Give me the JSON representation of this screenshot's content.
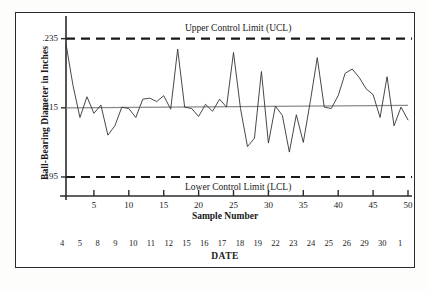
{
  "chart_data": {
    "type": "line",
    "title": "",
    "xlabel": "Sample Number",
    "ylabel": "Ball-Bearing Diameter in Inches",
    "xlim": [
      1,
      50
    ],
    "ylim": [
      0.1895,
      0.2375
    ],
    "grid": false,
    "legend_position": "none",
    "x": [
      1,
      2,
      3,
      4,
      5,
      6,
      7,
      8,
      9,
      10,
      11,
      12,
      13,
      14,
      15,
      16,
      17,
      18,
      19,
      20,
      21,
      22,
      23,
      24,
      25,
      26,
      27,
      28,
      29,
      30,
      31,
      32,
      33,
      34,
      35,
      36,
      37,
      38,
      39,
      40,
      41,
      42,
      43,
      44,
      45,
      46,
      47,
      48,
      49,
      50
    ],
    "series": [
      {
        "name": "Ball-Bearing Diameter",
        "values": [
          0.2335,
          0.2215,
          0.2122,
          0.2182,
          0.2134,
          0.2158,
          0.2071,
          0.2098,
          0.2152,
          0.2148,
          0.2122,
          0.2175,
          0.2178,
          0.2168,
          0.2185,
          0.2146,
          0.232,
          0.2152,
          0.2148,
          0.2125,
          0.216,
          0.214,
          0.2175,
          0.2152,
          0.231,
          0.2148,
          0.2038,
          0.2062,
          0.2255,
          0.2048,
          0.2155,
          0.2128,
          0.2022,
          0.213,
          0.205,
          0.2168,
          0.2295,
          0.2152,
          0.2148,
          0.2185,
          0.225,
          0.2262,
          0.2238,
          0.2205,
          0.2188,
          0.2122,
          0.224,
          0.2098,
          0.2152,
          0.2115
        ]
      }
    ],
    "reference_lines": [
      {
        "id": "ucl",
        "label": "Upper Control Limit (UCL)",
        "value": 0.235,
        "style": "dashed"
      },
      {
        "id": "center",
        "label": "",
        "value_start": 0.215,
        "value_end": 0.2157,
        "style": "solid"
      },
      {
        "id": "lcl",
        "label": "Lower Control Limit (LCL)",
        "value": 0.195,
        "style": "dashed"
      }
    ],
    "yticks": [
      {
        "value": 0.235,
        "label": ".235"
      },
      {
        "value": 0.215,
        "label": ".215"
      },
      {
        "value": 0.195,
        "label": ".195"
      }
    ],
    "xticks": [
      {
        "value": 5,
        "label": "5"
      },
      {
        "value": 10,
        "label": "10"
      },
      {
        "value": 15,
        "label": "15"
      },
      {
        "value": 20,
        "label": "20"
      },
      {
        "value": 25,
        "label": "25"
      },
      {
        "value": 30,
        "label": "30"
      },
      {
        "value": 35,
        "label": "35"
      },
      {
        "value": 40,
        "label": "40"
      },
      {
        "value": 45,
        "label": "45"
      },
      {
        "value": 50,
        "label": "50"
      }
    ],
    "secondary_axis": {
      "title": "DATE",
      "labels": [
        "4",
        "5",
        "8",
        "9",
        "10",
        "11",
        "12",
        "15",
        "16",
        "17",
        "18",
        "19",
        "22",
        "23",
        "24",
        "25",
        "26",
        "29",
        "30",
        "1"
      ]
    },
    "colors": {
      "series_line": "#333333",
      "limit_line": "#1a1a1a",
      "center_line": "#8a8a8a",
      "axis": "#2b2b2b",
      "text": "#1a1a1a",
      "background": "#ffffff"
    }
  }
}
